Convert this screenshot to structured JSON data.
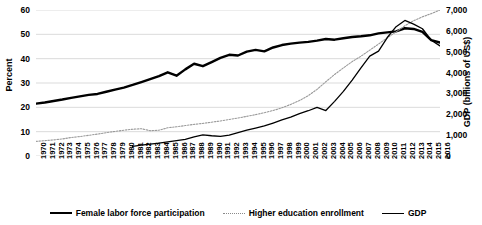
{
  "chart_data": {
    "type": "line",
    "title": "",
    "xlabel": "",
    "ylabel": "Percent",
    "y2label": "GDP (billions of US$)",
    "ylim": [
      0,
      60
    ],
    "y2lim": [
      0,
      7000
    ],
    "grid": true,
    "legend_position": "bottom",
    "yticks": [
      "0",
      "10",
      "20",
      "30",
      "40",
      "50",
      "60"
    ],
    "y2ticks": [
      "0",
      "1,000",
      "2,000",
      "3,000",
      "4,000",
      "5,000",
      "6,000",
      "7,000"
    ],
    "categories": [
      "1970",
      "1971",
      "1972",
      "1973",
      "1974",
      "1975",
      "1976",
      "1977",
      "1978",
      "1979",
      "1980",
      "1981",
      "1982",
      "1983",
      "1984",
      "1985",
      "1986",
      "1987",
      "1988",
      "1989",
      "1990",
      "1991",
      "1992",
      "1993",
      "1994",
      "1995",
      "1996",
      "1997",
      "1998",
      "1999",
      "2000",
      "2001",
      "2002",
      "2003",
      "2004",
      "2005",
      "2006",
      "2007",
      "2008",
      "2009",
      "2010",
      "2011",
      "2012",
      "2013",
      "2014",
      "2015",
      "2016"
    ],
    "series": [
      {
        "name": "Female labor force participation",
        "axis": "left",
        "units": "percent",
        "color": "#000000",
        "style": "solid-thick",
        "values": [
          21.5,
          22.0,
          22.6,
          23.2,
          23.9,
          24.5,
          25.1,
          25.5,
          26.4,
          27.3,
          28.1,
          29.2,
          30.4,
          31.6,
          32.8,
          34.4,
          33.0,
          35.6,
          37.9,
          36.9,
          38.6,
          40.3,
          41.6,
          41.3,
          42.9,
          43.6,
          43.0,
          44.6,
          45.6,
          46.2,
          46.6,
          46.9,
          47.4,
          48.1,
          47.8,
          48.4,
          48.9,
          49.2,
          49.6,
          50.4,
          50.8,
          51.2,
          52.5,
          52.2,
          51.0,
          47.6,
          46.6
        ]
      },
      {
        "name": "Higher education enrollment",
        "axis": "left",
        "units": "percent",
        "color": "#9a9a9a",
        "style": "dotted-thin",
        "values": [
          6.0,
          6.3,
          6.6,
          7.0,
          7.6,
          8.0,
          8.5,
          9.0,
          9.6,
          10.1,
          10.6,
          11.0,
          11.2,
          10.4,
          10.6,
          11.6,
          12.0,
          12.5,
          13.0,
          13.4,
          13.9,
          14.4,
          15.0,
          15.6,
          16.3,
          17.0,
          17.8,
          18.7,
          19.8,
          21.2,
          22.8,
          24.8,
          27.4,
          30.5,
          33.5,
          36.2,
          38.8,
          41.0,
          43.5,
          46.0,
          48.6,
          51.0,
          53.5,
          55.6,
          57.2,
          58.5,
          60.0
        ]
      },
      {
        "name": "GDP",
        "axis": "right",
        "units": "billions of US$",
        "color": "#000000",
        "style": "solid-thin",
        "values": [
          null,
          null,
          null,
          null,
          null,
          null,
          null,
          null,
          null,
          null,
          null,
          460,
          520,
          570,
          620,
          680,
          740,
          800,
          920,
          1010,
          970,
          940,
          1000,
          1120,
          1240,
          1340,
          1440,
          1580,
          1730,
          1860,
          2030,
          2170,
          2330,
          2180,
          2620,
          3100,
          3640,
          4230,
          4790,
          5030,
          5680,
          6200,
          6500,
          6320,
          6100,
          5550,
          5280
        ]
      }
    ]
  }
}
